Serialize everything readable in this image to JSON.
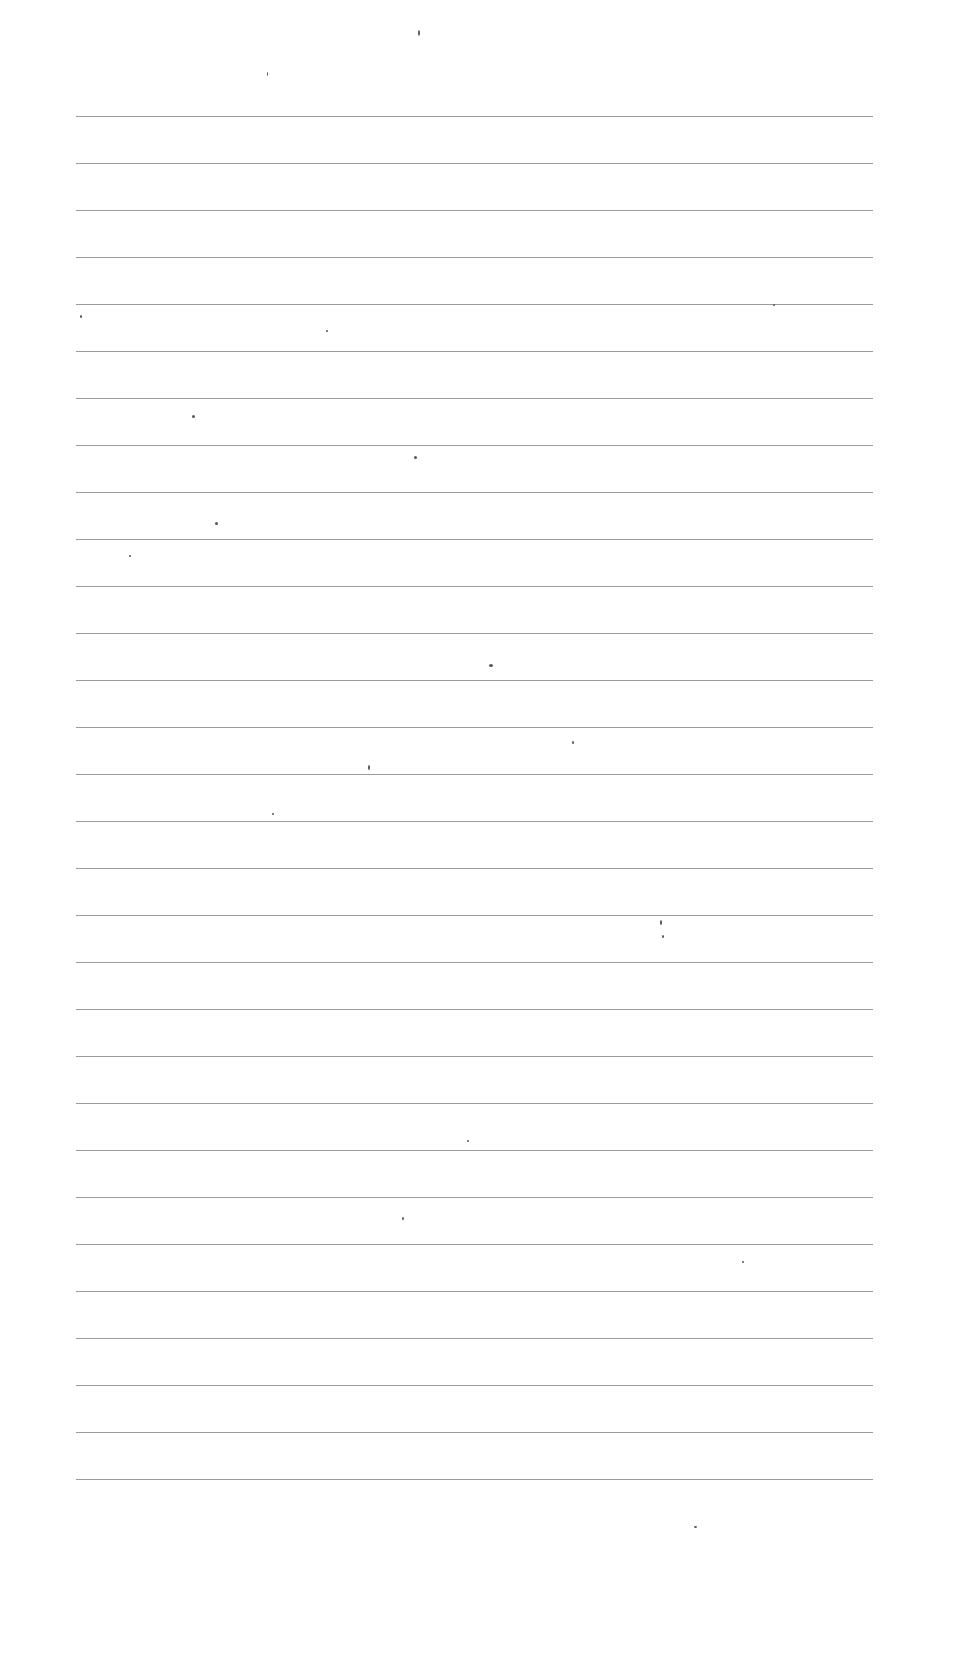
{
  "page": {
    "type": "blank-lined-paper",
    "background": "#ffffff",
    "rule_color": "#8a8a8a",
    "rule_count": 30,
    "rule_left": 76,
    "rule_right": 873,
    "first_rule_y": 116,
    "last_rule_y": 1479,
    "text": ""
  }
}
